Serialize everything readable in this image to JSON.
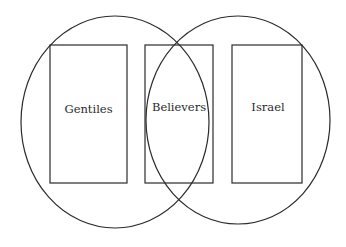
{
  "diagram": {
    "type": "venn",
    "circles": [
      {
        "id": "left",
        "cx": 115,
        "cy": 122,
        "rx": 94,
        "ry": 106
      },
      {
        "id": "right",
        "cx": 238,
        "cy": 120,
        "rx": 92,
        "ry": 104
      }
    ],
    "boxes": [
      {
        "id": "gentiles",
        "label": "Gentiles",
        "x": 50,
        "y": 45,
        "w": 77,
        "h": 138
      },
      {
        "id": "believers",
        "label": "Believers",
        "x": 145,
        "y": 45,
        "w": 68,
        "h": 138
      },
      {
        "id": "israel",
        "label": "Israel",
        "x": 232,
        "y": 45,
        "w": 70,
        "h": 138
      }
    ],
    "labels": {
      "gentiles": "Gentiles",
      "believers": "Believers",
      "israel": "Israel"
    },
    "stroke_color": "#2b2b2b",
    "background": "#ffffff"
  }
}
